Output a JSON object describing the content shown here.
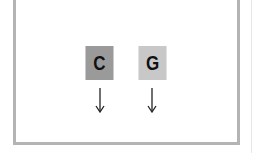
{
  "diagram": {
    "boxes": [
      {
        "label": "C",
        "color": "#9a9a9a"
      },
      {
        "label": "G",
        "color": "#c8c8c8"
      }
    ],
    "arrows": [
      {
        "direction": "down",
        "under": "C"
      },
      {
        "direction": "down",
        "under": "G"
      }
    ],
    "frame_color": "#b4b4b4"
  }
}
